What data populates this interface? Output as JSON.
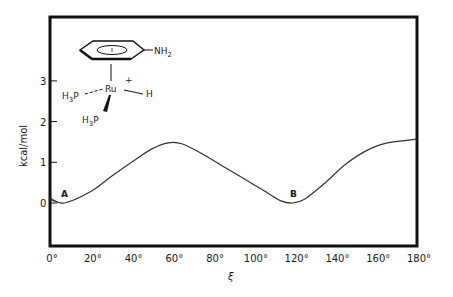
{
  "chart_data": {
    "type": "line",
    "title": "",
    "xlabel": "ξ",
    "ylabel": "kcal/mol",
    "xlim": [
      0,
      180
    ],
    "ylim": [
      -1,
      4.5
    ],
    "grid": false,
    "x_ticks": [
      "0°",
      "20°",
      "40°",
      "60°",
      "80°",
      "100°",
      "120°",
      "140°",
      "160°",
      "180°"
    ],
    "y_ticks": [
      "0",
      "1",
      "2",
      "3"
    ],
    "series": [
      {
        "name": "rotation energy profile",
        "x": [
          0,
          7,
          20,
          30,
          40,
          50,
          58,
          65,
          75,
          85,
          95,
          105,
          113,
          119,
          125,
          135,
          145,
          155,
          165,
          180
        ],
        "values": [
          0.12,
          0.0,
          0.28,
          0.65,
          1.0,
          1.33,
          1.48,
          1.45,
          1.2,
          0.9,
          0.6,
          0.3,
          0.06,
          0.0,
          0.1,
          0.5,
          0.95,
          1.28,
          1.47,
          1.57
        ]
      }
    ],
    "annotations": [
      {
        "label": "A",
        "x": 7,
        "y": 0.0
      },
      {
        "label": "B",
        "x": 119,
        "y": 0.0
      }
    ],
    "inset_structure": {
      "substituent": "NH2",
      "metal": "Ru",
      "charge": "+",
      "ligands": [
        "H3P",
        "H3P",
        "H"
      ]
    }
  },
  "labels": {
    "xlabel": "ξ",
    "ylabel": "kcal/mol",
    "point_a": "A",
    "point_b": "B",
    "mol_nh": "NH",
    "mol_nh_sub": "2",
    "mol_ru": "Ru",
    "mol_plus": "+",
    "mol_h": "H",
    "mol_h3p_1": "H",
    "mol_h3p_1_sub": "3",
    "mol_h3p_1_p": "P",
    "mol_h3p_2": "H",
    "mol_h3p_2_sub": "3",
    "mol_h3p_2_p": "P"
  }
}
